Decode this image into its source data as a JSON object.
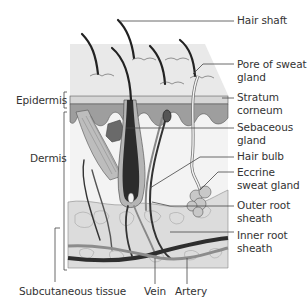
{
  "colors": {
    "background": "#ffffff",
    "skin_block": "#e6e6e6",
    "stratum_corneum": "#d4d4d4",
    "epidermis_dark": "#9a9a9a",
    "hair": "#2a2a2a",
    "leader_line": "#444444",
    "fat_tissue": "#d9d9d9",
    "vessel_dark": "#2e2e2e",
    "vessel_light": "#8c8c8c",
    "label_text": "#333333"
  },
  "labels": {
    "right": [
      {
        "id": "hair-shaft",
        "text": "Hair shaft"
      },
      {
        "id": "pore-of-sweat-gland",
        "text": "Pore of sweat gland"
      },
      {
        "id": "stratum-corneum",
        "text": "Stratum corneum"
      },
      {
        "id": "sebaceous-gland",
        "text": "Sebaceous gland"
      },
      {
        "id": "hair-bulb",
        "text": "Hair bulb"
      },
      {
        "id": "eccrine-sweat-gland",
        "text": "Eccrine sweat gland"
      },
      {
        "id": "outer-root-sheath",
        "text": "Outer root sheath"
      },
      {
        "id": "inner-root-sheath",
        "text": "Inner root sheath"
      }
    ],
    "left": [
      {
        "id": "epidermis",
        "text": "Epidermis"
      },
      {
        "id": "dermis",
        "text": "Dermis"
      }
    ],
    "bottom": [
      {
        "id": "subcutaneous-tissue",
        "text": "Subcutaneous tissue"
      },
      {
        "id": "vein",
        "text": "Vein"
      },
      {
        "id": "artery",
        "text": "Artery"
      }
    ]
  }
}
